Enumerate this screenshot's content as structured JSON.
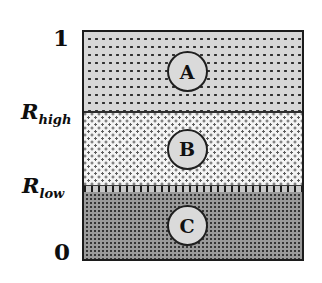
{
  "figure": {
    "type": "stacked-band-diagram",
    "y_axis": {
      "top_tick": "1",
      "bottom_tick": "0",
      "upper_threshold": {
        "base": "R",
        "sub": "high"
      },
      "lower_threshold": {
        "base": "R",
        "sub": "low"
      }
    },
    "bands": [
      {
        "label": "A",
        "from": "R_high",
        "to": "1",
        "pattern": "sparse-dark-dots-on-light-gray"
      },
      {
        "label": "B",
        "from": "R_low",
        "to": "R_high",
        "pattern": "diagonal-dots-on-white"
      },
      {
        "label": "C",
        "from": "0",
        "to": "R_low",
        "pattern": "dense-dark-dots-on-gray"
      }
    ],
    "colors": {
      "band_a_bg": "#d7d7d7",
      "band_b_bg": "#f4f4f4",
      "band_c_bg": "#9a9a9a",
      "dot_dark": "#2f2f2f",
      "border": "#1c1c1c",
      "marker_fill": "#dadada",
      "text": "#0e0e0e"
    }
  }
}
